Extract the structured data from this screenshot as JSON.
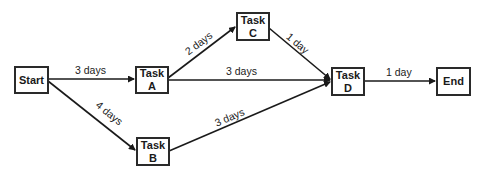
{
  "diagram": {
    "type": "activity-on-node network",
    "nodes": [
      {
        "id": "start",
        "line1": "Start",
        "line2": ""
      },
      {
        "id": "a",
        "line1": "Task",
        "line2": "A"
      },
      {
        "id": "b",
        "line1": "Task",
        "line2": "B"
      },
      {
        "id": "c",
        "line1": "Task",
        "line2": "C"
      },
      {
        "id": "d",
        "line1": "Task",
        "line2": "D"
      },
      {
        "id": "end",
        "line1": "End",
        "line2": ""
      }
    ],
    "edges": [
      {
        "from": "Start",
        "to": "Task A",
        "label": "3 days"
      },
      {
        "from": "Start",
        "to": "Task B",
        "label": "4 days"
      },
      {
        "from": "Task A",
        "to": "Task C",
        "label": "2 days"
      },
      {
        "from": "Task A",
        "to": "Task D",
        "label": "3 days"
      },
      {
        "from": "Task B",
        "to": "Task D",
        "label": "3 days"
      },
      {
        "from": "Task C",
        "to": "Task D",
        "label": "1 day"
      },
      {
        "from": "Task D",
        "to": "End",
        "label": "1 day"
      }
    ]
  }
}
